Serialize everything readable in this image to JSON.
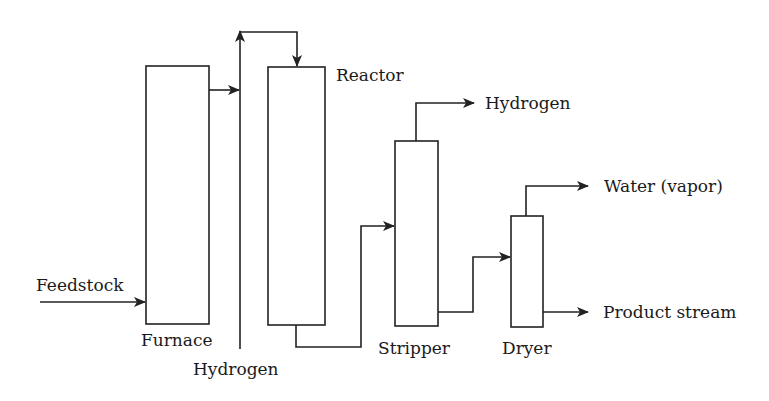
{
  "diagram": {
    "type": "process-flow",
    "units": [
      {
        "id": "furnace",
        "label": "Furnace"
      },
      {
        "id": "reactor",
        "label": "Reactor"
      },
      {
        "id": "stripper",
        "label": "Stripper"
      },
      {
        "id": "dryer",
        "label": "Dryer"
      }
    ],
    "streams": {
      "feedstock": "Feedstock",
      "hydrogen_in": "Hydrogen",
      "hydrogen_out": "Hydrogen",
      "water": "Water (vapor)",
      "product": "Product stream"
    },
    "line_color": "#222222"
  }
}
